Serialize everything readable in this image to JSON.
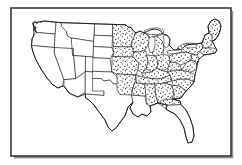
{
  "figure": {
    "title": "Map of the contiguous United States",
    "width": 242,
    "height": 165,
    "background_color": "#ffffff",
    "line_color": "#2a2a2a",
    "frame_color": "#3a3a3a",
    "fill_pattern": "stipple-dots",
    "stipple_color": "#1a1a1a"
  },
  "frame": {
    "x": 11,
    "y": 8,
    "width": 220,
    "height": 148,
    "stroke_width": 1.6,
    "has_drop_shadow": true
  },
  "legend": {
    "shaded_meaning": "stippled region",
    "unshaded_meaning": "unstippled region"
  },
  "regions": [
    {
      "name": "west",
      "label": "Western states",
      "shaded": false,
      "states": [
        "Washington",
        "Oregon",
        "California",
        "Idaho",
        "Nevada",
        "Utah",
        "Arizona",
        "Montana",
        "Wyoming",
        "Colorado",
        "New Mexico"
      ]
    },
    {
      "name": "plains",
      "label": "Great Plains states",
      "shaded": false,
      "states": [
        "North Dakota",
        "South Dakota",
        "Nebraska",
        "Kansas",
        "Oklahoma",
        "Texas"
      ]
    },
    {
      "name": "midwest-east",
      "label": "Midwest and Eastern states",
      "shaded": true,
      "states": [
        "Minnesota",
        "Iowa",
        "Missouri",
        "Arkansas",
        "Wisconsin",
        "Illinois",
        "Michigan",
        "Indiana",
        "Ohio",
        "Kentucky",
        "Tennessee",
        "Mississippi",
        "Alabama",
        "Georgia",
        "South Carolina",
        "North Carolina",
        "Virginia",
        "West Virginia",
        "Pennsylvania",
        "New York",
        "Maryland",
        "Delaware",
        "New Jersey",
        "Connecticut",
        "Rhode Island",
        "Massachusetts",
        "Vermont",
        "New Hampshire",
        "Maine"
      ]
    },
    {
      "name": "gulf-south",
      "label": "Gulf coast and Florida",
      "shaded": false,
      "states": [
        "Louisiana",
        "Florida"
      ]
    }
  ],
  "features": {
    "great_lakes": [
      "Lake Superior",
      "Lake Michigan",
      "Lake Huron",
      "Lake Erie",
      "Lake Ontario"
    ],
    "peninsulas": [
      "Florida",
      "Michigan Upper Peninsula",
      "Cape Cod"
    ]
  }
}
